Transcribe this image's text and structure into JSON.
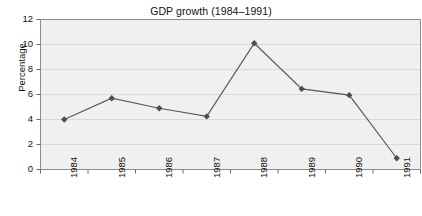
{
  "chart_data": {
    "type": "line",
    "title": "GDP growth (1984–1991)",
    "xlabel": "",
    "ylabel": "Percentage",
    "categories": [
      "1984",
      "1985",
      "1986",
      "1987",
      "1988",
      "1989",
      "1990",
      "1991"
    ],
    "values": [
      4.0,
      5.7,
      4.9,
      4.25,
      10.1,
      6.45,
      5.95,
      0.9
    ],
    "series": [
      {
        "name": "GDP growth",
        "values": [
          4.0,
          5.7,
          4.9,
          4.25,
          10.1,
          6.45,
          5.95,
          0.9
        ]
      }
    ],
    "ylim": [
      0,
      12
    ],
    "ytick_labels": [
      "0",
      "2",
      "4",
      "6",
      "8",
      "10",
      "12"
    ],
    "ytick_values": [
      0,
      2,
      4,
      6,
      8,
      10,
      12
    ],
    "xtick_labels": [
      "1984",
      "1985",
      "1986",
      "1987",
      "1988",
      "1989",
      "1990",
      "1991"
    ],
    "grid": "horizontal",
    "legend": "none",
    "marker": "diamond",
    "colors": {
      "line": "#595959",
      "marker": "#4d4d4d",
      "plot_background": "#f0f0f0",
      "gridline": "#d9d9d9",
      "axis": "#808080",
      "text": "#111111",
      "page_background": "#ffffff"
    }
  },
  "axes": {
    "y_title": "Percentage"
  }
}
